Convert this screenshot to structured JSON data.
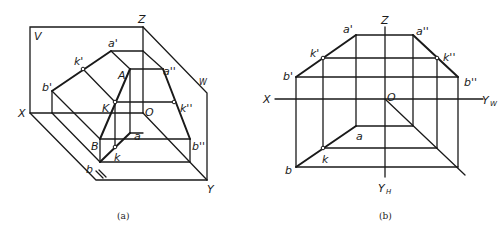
{
  "figure_a": {
    "caption": "(a)",
    "labels": {
      "V": "V",
      "Z": "Z",
      "W": "W",
      "X": "X",
      "O": "O",
      "Y": "Y",
      "H": "H",
      "a_prime": "a'",
      "k_prime": "k'",
      "b_prime": "b'",
      "A": "A",
      "K": "K",
      "B": "B",
      "a_dprime": "a''",
      "k_dprime": "k''",
      "b_dprime": "b''",
      "a": "a",
      "k": "k",
      "b": "b"
    }
  },
  "figure_b": {
    "caption": "(b)",
    "labels": {
      "Z": "Z",
      "X": "X",
      "O": "O",
      "Yw": "Y",
      "Yw_sub": "W",
      "Yh": "Y",
      "Yh_sub": "H",
      "a_prime": "a'",
      "k_prime": "k'",
      "b_prime": "b'",
      "a_dprime": "a''",
      "k_dprime": "k''",
      "b_dprime": "b''",
      "a": "a",
      "k": "k",
      "b": "b"
    }
  }
}
